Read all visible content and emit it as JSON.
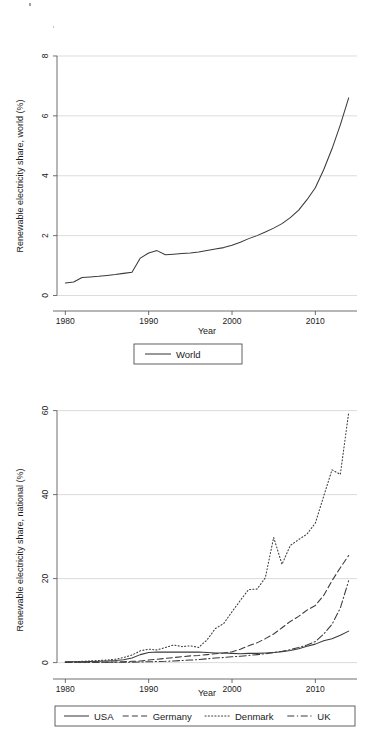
{
  "figure": {
    "background_color": "#ffffff",
    "line_color": "#3a3a3a",
    "grid_color": "#d8d8d8",
    "axis_color": "#4a4a4a"
  },
  "chart_data": [
    {
      "id": "world",
      "type": "line",
      "title": "",
      "xlabel": "Year",
      "ylabel": "Renewable electricity share, world (%)",
      "xlim": [
        1979,
        2015
      ],
      "ylim": [
        -0.25,
        8.4
      ],
      "xticks": [
        1980,
        1990,
        2000,
        2010
      ],
      "xticklabels": [
        "1980",
        "1990",
        "2000",
        "2010"
      ],
      "yticks": [
        0,
        2,
        4,
        6,
        8
      ],
      "yticklabels": [
        "0",
        "2",
        "4",
        "6",
        "8"
      ],
      "grid": "horizontal",
      "legend_position": "below",
      "x": [
        1980,
        1981,
        1982,
        1983,
        1984,
        1985,
        1986,
        1987,
        1988,
        1989,
        1990,
        1991,
        1992,
        1993,
        1994,
        1995,
        1996,
        1997,
        1998,
        1999,
        2000,
        2001,
        2002,
        2003,
        2004,
        2005,
        2006,
        2007,
        2008,
        2009,
        2010,
        2011,
        2012,
        2013,
        2014
      ],
      "series": [
        {
          "name": "World",
          "style": "solid",
          "values": [
            0.42,
            0.45,
            0.6,
            0.62,
            0.64,
            0.67,
            0.7,
            0.74,
            0.78,
            1.25,
            1.42,
            1.5,
            1.36,
            1.38,
            1.4,
            1.42,
            1.45,
            1.5,
            1.55,
            1.6,
            1.68,
            1.78,
            1.9,
            2.0,
            2.12,
            2.25,
            2.4,
            2.6,
            2.85,
            3.2,
            3.6,
            4.2,
            4.9,
            5.7,
            6.6
          ]
        }
      ]
    },
    {
      "id": "national",
      "type": "line",
      "title": "",
      "xlabel": "Year",
      "ylabel": "Renewable electricity share, national (%)",
      "xlim": [
        1979,
        2015
      ],
      "ylim": [
        -2,
        63
      ],
      "xticks": [
        1980,
        1990,
        2000,
        2010
      ],
      "xticklabels": [
        "1980",
        "1990",
        "2000",
        "2010"
      ],
      "yticks": [
        0,
        20,
        40,
        60
      ],
      "yticklabels": [
        "0",
        "20",
        "40",
        "60"
      ],
      "grid": "horizontal",
      "legend_position": "below",
      "x": [
        1980,
        1981,
        1982,
        1983,
        1984,
        1985,
        1986,
        1987,
        1988,
        1989,
        1990,
        1991,
        1992,
        1993,
        1994,
        1995,
        1996,
        1997,
        1998,
        1999,
        2000,
        2001,
        2002,
        2003,
        2004,
        2005,
        2006,
        2007,
        2008,
        2009,
        2010,
        2011,
        2012,
        2013,
        2014
      ],
      "series": [
        {
          "name": "USA",
          "style": "solid",
          "values": [
            0.2,
            0.2,
            0.2,
            0.25,
            0.3,
            0.4,
            0.5,
            0.7,
            1.1,
            1.9,
            2.4,
            2.5,
            2.5,
            2.5,
            2.5,
            2.5,
            2.5,
            2.4,
            2.3,
            2.3,
            2.2,
            2.1,
            2.2,
            2.2,
            2.3,
            2.4,
            2.6,
            2.9,
            3.3,
            3.9,
            4.4,
            5.2,
            5.7,
            6.5,
            7.5
          ]
        },
        {
          "name": "Germany",
          "style": "dashed",
          "values": [
            0.1,
            0.1,
            0.1,
            0.1,
            0.1,
            0.1,
            0.15,
            0.2,
            0.3,
            0.4,
            0.6,
            0.8,
            1.0,
            1.2,
            1.4,
            1.6,
            1.7,
            1.9,
            2.1,
            2.3,
            2.6,
            3.2,
            4.0,
            4.7,
            5.7,
            6.8,
            8.3,
            9.8,
            11.0,
            12.5,
            13.6,
            16.0,
            19.5,
            22.6,
            25.5
          ]
        },
        {
          "name": "Denmark",
          "style": "dotted",
          "values": [
            0.1,
            0.2,
            0.3,
            0.4,
            0.5,
            0.6,
            0.8,
            1.2,
            1.8,
            2.8,
            3.2,
            3.0,
            3.6,
            4.2,
            3.8,
            4.0,
            3.6,
            5.4,
            8.1,
            9.3,
            12.1,
            14.8,
            17.4,
            17.5,
            20.2,
            29.8,
            23.4,
            27.9,
            29.3,
            30.6,
            33.2,
            39.6,
            45.9,
            44.8,
            59.5
          ]
        },
        {
          "name": "UK",
          "style": "dashdot",
          "values": [
            0.1,
            0.1,
            0.1,
            0.1,
            0.1,
            0.1,
            0.1,
            0.1,
            0.1,
            0.15,
            0.2,
            0.25,
            0.3,
            0.4,
            0.5,
            0.6,
            0.7,
            0.9,
            1.1,
            1.2,
            1.4,
            1.5,
            1.7,
            1.9,
            2.1,
            2.4,
            2.7,
            3.1,
            3.6,
            4.2,
            5.0,
            6.8,
            9.1,
            13.0,
            19.5
          ]
        }
      ]
    }
  ]
}
